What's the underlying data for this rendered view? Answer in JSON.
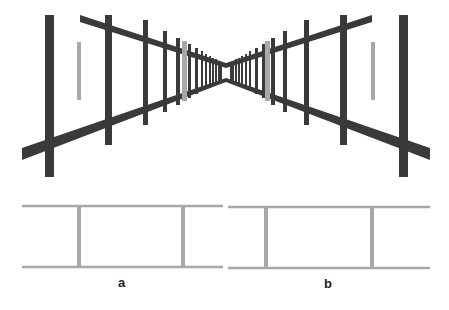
{
  "figure": {
    "type": "perspective-illusion",
    "colors": {
      "dark": "#3a3a3a",
      "gray": "#a8a8a8",
      "background": "#ffffff"
    },
    "perspective": {
      "vanishing_point": [
        226,
        70
      ],
      "left_corridor": {
        "front_post": {
          "x": 45,
          "w": 9,
          "y1": 15,
          "y2": 177
        },
        "posts": [
          {
            "x": 105,
            "w": 7,
            "y1": 15,
            "y2": 145
          },
          {
            "x": 143,
            "w": 5,
            "y1": 20,
            "y2": 125
          },
          {
            "x": 163,
            "w": 4,
            "y1": 31,
            "y2": 112
          },
          {
            "x": 176,
            "w": 4,
            "y1": 38,
            "y2": 105
          },
          {
            "x": 188,
            "w": 3,
            "y1": 44,
            "y2": 98
          },
          {
            "x": 195,
            "w": 3,
            "y1": 48,
            "y2": 94
          },
          {
            "x": 201,
            "w": 2,
            "y1": 51,
            "y2": 90
          },
          {
            "x": 205,
            "w": 2,
            "y1": 54,
            "y2": 88
          },
          {
            "x": 209,
            "w": 2,
            "y1": 56,
            "y2": 86
          },
          {
            "x": 212,
            "w": 2,
            "y1": 58,
            "y2": 84
          },
          {
            "x": 215,
            "w": 2,
            "y1": 59,
            "y2": 83
          },
          {
            "x": 218,
            "w": 2,
            "y1": 61,
            "y2": 81
          },
          {
            "x": 220,
            "w": 2,
            "y1": 62,
            "y2": 80
          }
        ],
        "gray_bars": [
          {
            "x": 77,
            "w": 4,
            "y1": 42,
            "y2": 100
          },
          {
            "x": 182,
            "w": 5,
            "y1": 41,
            "y2": 101
          }
        ],
        "upper_rail": [
          [
            80,
            15
          ],
          [
            226,
            63
          ],
          [
            226,
            68
          ],
          [
            80,
            22
          ]
        ],
        "lower_rail": [
          [
            22,
            148
          ],
          [
            226,
            78
          ],
          [
            226,
            82
          ],
          [
            22,
            160
          ]
        ]
      },
      "right_corridor": {
        "front_post": {
          "x": 399,
          "w": 9,
          "y1": 15,
          "y2": 177
        },
        "posts": [
          {
            "x": 340,
            "w": 7,
            "y1": 15,
            "y2": 145
          },
          {
            "x": 304,
            "w": 5,
            "y1": 20,
            "y2": 125
          },
          {
            "x": 283,
            "w": 4,
            "y1": 31,
            "y2": 112
          },
          {
            "x": 271,
            "w": 4,
            "y1": 38,
            "y2": 105
          },
          {
            "x": 262,
            "w": 3,
            "y1": 44,
            "y2": 98
          },
          {
            "x": 255,
            "w": 3,
            "y1": 48,
            "y2": 94
          },
          {
            "x": 249,
            "w": 2,
            "y1": 51,
            "y2": 90
          },
          {
            "x": 245,
            "w": 2,
            "y1": 54,
            "y2": 88
          },
          {
            "x": 241,
            "w": 2,
            "y1": 56,
            "y2": 86
          },
          {
            "x": 238,
            "w": 2,
            "y1": 58,
            "y2": 84
          },
          {
            "x": 235,
            "w": 2,
            "y1": 59,
            "y2": 83
          },
          {
            "x": 232,
            "w": 2,
            "y1": 61,
            "y2": 81
          },
          {
            "x": 230,
            "w": 2,
            "y1": 62,
            "y2": 80
          }
        ],
        "gray_bars": [
          {
            "x": 371,
            "w": 4,
            "y1": 42,
            "y2": 100
          },
          {
            "x": 265,
            "w": 5,
            "y1": 41,
            "y2": 101
          }
        ],
        "upper_rail": [
          [
            372,
            15
          ],
          [
            226,
            63
          ],
          [
            226,
            68
          ],
          [
            372,
            22
          ]
        ],
        "lower_rail": [
          [
            430,
            148
          ],
          [
            226,
            78
          ],
          [
            226,
            82
          ],
          [
            430,
            160
          ]
        ]
      }
    },
    "panels": [
      {
        "label": "a",
        "x1": 22,
        "x2": 223,
        "top_y": 206,
        "bottom_y": 267,
        "posts_x": [
          79,
          183
        ],
        "label_pos": [
          118,
          275
        ]
      },
      {
        "label": "b",
        "x1": 228,
        "x2": 430,
        "top_y": 207,
        "bottom_y": 268,
        "posts_x": [
          266,
          372
        ],
        "label_pos": [
          324,
          276
        ]
      }
    ]
  }
}
